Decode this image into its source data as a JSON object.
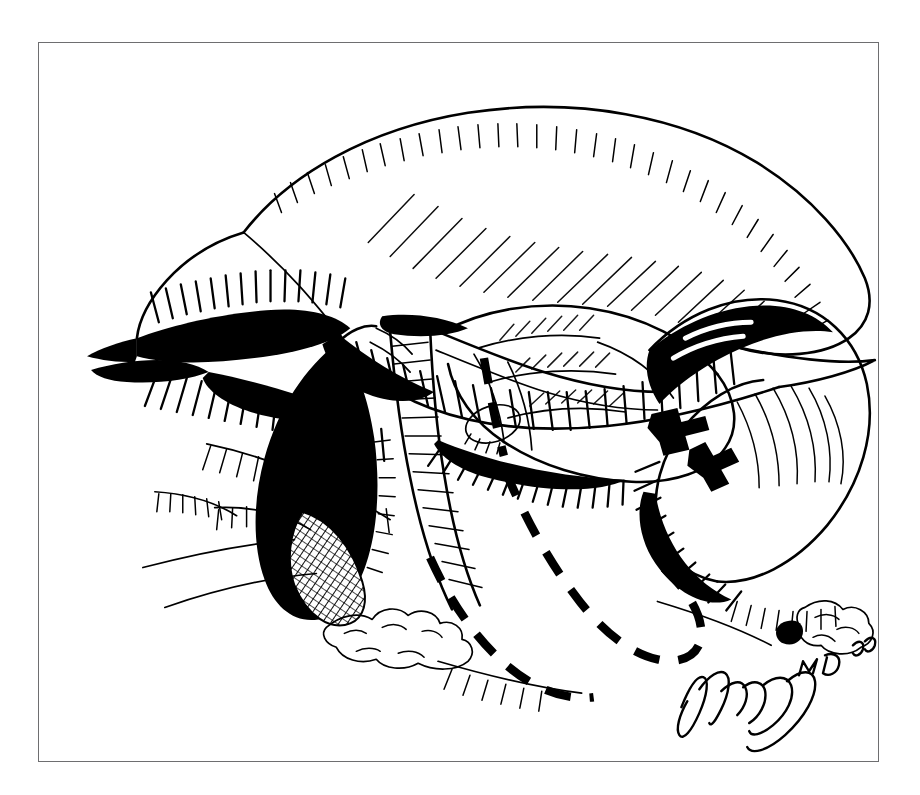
{
  "plate": {
    "medium": "pen-and-ink line drawing",
    "subject": "hepatobiliary operative field",
    "caption": "",
    "background_color": "#ffffff",
    "ink_color": "#000000",
    "frame_color": "#6e6e70"
  },
  "frame": {
    "x": 38,
    "y": 42,
    "width": 841,
    "height": 720,
    "border_width_px": 1.6
  },
  "structures": [
    {
      "id": "liver-right-lobe",
      "label": "liver right lobe, retracted cephalad",
      "shading": "dense parallel hatching along inferior margin"
    },
    {
      "id": "liver-left-lobe",
      "label": "liver left lobe",
      "shading": "solid black wedge with radiating hatch"
    },
    {
      "id": "falciform-fold",
      "label": "retracted peritoneal fold",
      "shading": "solid black with comb hatching"
    },
    {
      "id": "gallbladder",
      "label": "gallbladder",
      "shading": "solid black body with cross-hatched fundus"
    },
    {
      "id": "cystic-duct",
      "label": "cystic duct",
      "shading": "outline with light stipple"
    },
    {
      "id": "common-bile-duct",
      "label": "common bile duct",
      "shading": "outline with transverse hatch"
    },
    {
      "id": "duodenum",
      "label": "duodenum",
      "shading": "contour with fine interior hatch"
    },
    {
      "id": "pancreas-head",
      "label": "head of pancreas",
      "shading": "lobular outline, light hatch"
    },
    {
      "id": "stomach-antrum",
      "label": "stomach antrum",
      "shading": "broad pale form with edge hatching"
    },
    {
      "id": "omentum",
      "label": "omental fat",
      "shading": "scalloped bubbled outline"
    }
  ],
  "annotations": {
    "resection_lines": [
      {
        "id": "resection-line-upper",
        "style": "dashed",
        "description": "near-vertical dashed transection plane"
      },
      {
        "id": "resection-line-loop",
        "style": "dashed",
        "description": "U-shaped dashed outline of planned resection margin"
      }
    ],
    "clips": [
      {
        "id": "surgical-clip-upper",
        "style": "solid cruciform ligature clip"
      },
      {
        "id": "surgical-clip-lower",
        "style": "solid cruciform ligature clip"
      }
    ]
  },
  "signature": {
    "artist_mark": "handwritten artist signature",
    "credential": "MD",
    "year": "96"
  }
}
